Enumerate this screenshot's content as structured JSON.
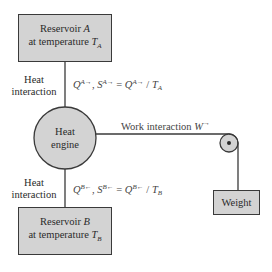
{
  "reservoir_a": {
    "line1": "Reservoir",
    "name": "A",
    "line2": "at temperature",
    "temp_symbol": "T",
    "temp_sub": "A"
  },
  "reservoir_b": {
    "line1": "Reservoir",
    "name": "B",
    "line2": "at temperature",
    "temp_symbol": "T",
    "temp_sub": "B"
  },
  "heat_engine": {
    "line1": "Heat",
    "line2": "engine"
  },
  "heat_interaction_top": {
    "line1": "Heat",
    "line2": "interaction"
  },
  "heat_interaction_bottom": {
    "line1": "Heat",
    "line2": "interaction"
  },
  "equation_top": {
    "q": "Q",
    "q_sup": "A→",
    "sep": ", ",
    "s": "S",
    "s_sup": "A→",
    "eq": " = ",
    "q2": "Q",
    "q2_sup": "A→",
    "div": " / ",
    "t": "T",
    "t_sub": "A"
  },
  "equation_bottom": {
    "q": "Q",
    "q_sup": "B←",
    "sep": ", ",
    "s": "S",
    "s_sup": "B←",
    "eq": " = ",
    "q2": "Q",
    "q2_sup": "B←",
    "div": " / ",
    "t": "T",
    "t_sub": "B"
  },
  "work_interaction": {
    "label": "Work interaction ",
    "symbol": "W",
    "sup": "→"
  },
  "weight": {
    "label": "Weight"
  },
  "colors": {
    "box_fill": "#d3d3d3",
    "stroke": "#3a3a3a",
    "background": "#ffffff"
  }
}
